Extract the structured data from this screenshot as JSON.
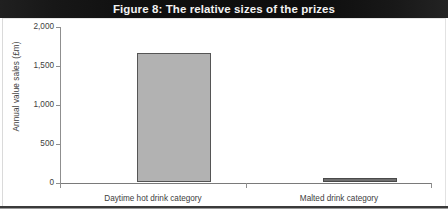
{
  "figure": {
    "title": "Figure 8: The relative sizes of the prizes",
    "title_bar_color": "#141414",
    "title_text_color": "#f2f2f2",
    "background_color": "#ffffff"
  },
  "chart_data": {
    "type": "bar",
    "title": "Figure 8: The relative sizes of the prizes",
    "categories": [
      "Daytime hot drink category",
      "Malted drink category"
    ],
    "values": [
      1650,
      50
    ],
    "xlabel": "",
    "ylabel": "Annual value sales (£m)",
    "ylim": [
      0,
      2000
    ],
    "yticks": [
      0,
      500,
      1000,
      1500,
      2000
    ],
    "ytick_labels": [
      "0",
      "500",
      "1,000",
      "1,500",
      "2,000"
    ],
    "grid": false,
    "legend": false,
    "bar_colors": [
      "#b2b2b2",
      "#6f6f6f"
    ],
    "bar_edge_colors": [
      "#555555",
      "#4a4a4a"
    ]
  }
}
